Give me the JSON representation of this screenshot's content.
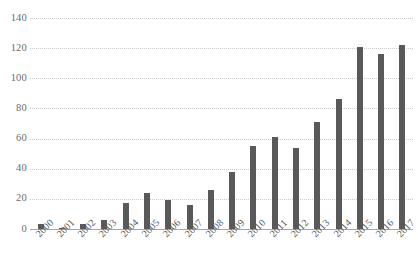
{
  "chart_data": {
    "type": "bar",
    "title": "",
    "xlabel": "",
    "ylabel": "",
    "ylim": [
      0,
      140
    ],
    "ytick_step": 20,
    "yticks": [
      140,
      120,
      100,
      80,
      60,
      40,
      20,
      0
    ],
    "grid": true,
    "legend": "none",
    "bar_color": "#595959",
    "gridline_color": "#c9c9c9",
    "axis_color": "#a6a6a6",
    "background_color": "#ffffff",
    "categories": [
      "2000",
      "2001",
      "2002",
      "2003",
      "2004",
      "2005",
      "2006",
      "2007",
      "2008",
      "2009",
      "2010",
      "2011",
      "2012",
      "2013",
      "2014",
      "2015",
      "2016",
      "2017"
    ],
    "values": [
      3,
      1,
      3,
      6,
      17,
      24,
      19,
      16,
      26,
      38,
      55,
      61,
      54,
      71,
      86,
      121,
      116,
      122
    ]
  }
}
